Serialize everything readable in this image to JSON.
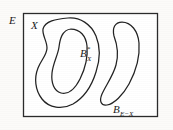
{
  "figure": {
    "kind": "set-theory-topology-diagram",
    "background_color": "#fcfbf9",
    "ink_color": "#222222",
    "universe": {
      "label": "E",
      "label_x": 9,
      "label_y": 24
    },
    "regions": [
      {
        "id": "set-x",
        "label": "X",
        "label_x": 31,
        "label_y": 29
      },
      {
        "id": "boundary-x-star",
        "label_base": "B",
        "label_sub": "X",
        "label_sup": "*",
        "label_x": 80,
        "label_y": 57
      },
      {
        "id": "boundary-e-minus-x",
        "label_base": "B",
        "label_sub": "E−X",
        "label_x": 113,
        "label_y": 113
      }
    ]
  }
}
